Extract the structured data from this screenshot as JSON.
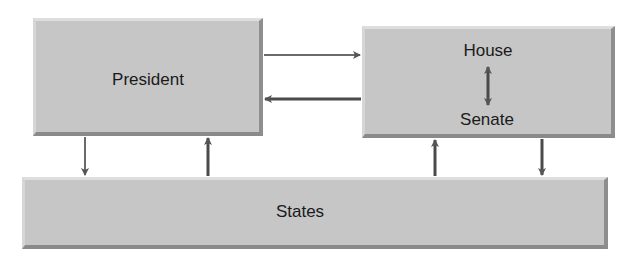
{
  "diagram": {
    "nodes": {
      "president": {
        "label": "President"
      },
      "congress": {
        "house_label": "House",
        "senate_label": "Senate"
      },
      "states": {
        "label": "States"
      }
    },
    "edges": [
      {
        "from": "President",
        "to": "Congress",
        "direction": "right"
      },
      {
        "from": "Congress",
        "to": "President",
        "direction": "left"
      },
      {
        "from": "House",
        "to": "Senate",
        "direction": "bidirectional"
      },
      {
        "from": "President",
        "to": "States",
        "direction": "down"
      },
      {
        "from": "States",
        "to": "President",
        "direction": "up"
      },
      {
        "from": "States",
        "to": "Congress",
        "direction": "up"
      },
      {
        "from": "Congress",
        "to": "States",
        "direction": "down"
      }
    ],
    "colors": {
      "box_fill": "#c6c6c6",
      "box_shadow": "#8c8c8c",
      "arrow": "#555555",
      "text": "#1a1a1a"
    }
  }
}
